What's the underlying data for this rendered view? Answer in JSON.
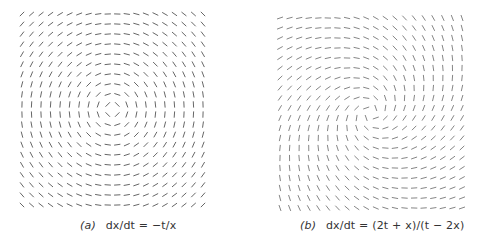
{
  "chart_data": [
    {
      "type": "direction-field",
      "title": "(a) dx/dt = −t/x",
      "label": "(a)",
      "equation": "dx/dt = −t/x",
      "slope": "-t/x",
      "grid": {
        "cols": 20,
        "rows": 20,
        "t_range": [
          -1,
          1
        ],
        "x_range": [
          -1,
          1
        ]
      },
      "center": [
        0,
        0
      ],
      "description": "Concentric circular direction field centered at origin",
      "axes_visible": false
    },
    {
      "type": "direction-field",
      "title": "(b) dx/dt = (2t + x)/(t − 2x)",
      "label": "(b)",
      "equation": "dx/dt = (2t + x)/(t − 2x)",
      "slope": "(2t+x)/(t-2x)",
      "grid": {
        "cols": 20,
        "rows": 20,
        "t_range": [
          -1,
          1
        ],
        "x_range": [
          -1,
          1
        ]
      },
      "center": [
        0,
        0
      ],
      "description": "Spiral direction field with vertical discontinuity along t = 2x",
      "axes_visible": false
    }
  ],
  "panels": {
    "a": {
      "label": "(a)",
      "equation": "dx/dt = −t/x",
      "stroke": "#555555"
    },
    "b": {
      "label": "(b)",
      "equation": "dx/dt = (2t + x)/(t − 2x)",
      "stroke": "#777777"
    }
  }
}
